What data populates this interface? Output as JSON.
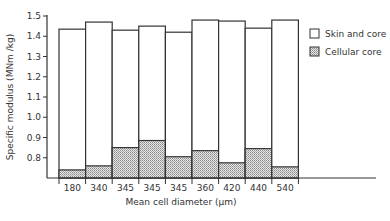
{
  "chart_data": {
    "type": "bar",
    "subtype": "overlaid",
    "title": "",
    "xlabel": "Mean cell diameter (µm)",
    "ylabel": "Specific modulus (MNm /kg)",
    "categories": [
      "180",
      "340",
      "345",
      "345",
      "345",
      "360",
      "420",
      "440",
      "540"
    ],
    "series": [
      {
        "name": "Skin and core",
        "fill": "white",
        "values": [
          1.435,
          1.47,
          1.43,
          1.45,
          1.42,
          1.48,
          1.475,
          1.44,
          1.48
        ]
      },
      {
        "name": "Cellular core",
        "fill": "hatched",
        "values": [
          0.74,
          0.76,
          0.85,
          0.885,
          0.805,
          0.835,
          0.775,
          0.845,
          0.755
        ]
      }
    ],
    "yticks": [
      0.8,
      0.9,
      1.0,
      1.1,
      1.2,
      1.3,
      1.4,
      1.5
    ],
    "ytick_labels": [
      "0.8",
      "0.9",
      "1.0",
      "1.1",
      "1.2",
      "1.3",
      "1.4",
      "1.5"
    ],
    "ylim": [
      0.7,
      1.5
    ],
    "grid": false,
    "legend_position": "right"
  },
  "legend": {
    "items": [
      {
        "label": "Skin and core"
      },
      {
        "label": "Cellular core"
      }
    ]
  }
}
